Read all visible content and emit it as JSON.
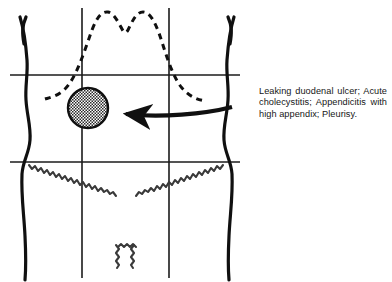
{
  "figure": {
    "caption": "Leaking duodenal ulcer; Acute cholecystitis; Appendicitis with high appendix; Pleurisy.",
    "colors": {
      "ink": "#101010",
      "grid": "#1b1b1b",
      "background": "#ffffff",
      "lesion_fill": "#9a9a9a",
      "lesion_stroke": "#101010"
    },
    "grid": {
      "horizontal_lines": [
        {
          "name": "subcostal-line",
          "y": 75,
          "x_start": 10,
          "x_end": 240
        },
        {
          "name": "interspinous-line",
          "y": 162,
          "x_start": 10,
          "x_end": 240
        }
      ],
      "vertical_lines": [
        {
          "name": "left-midclavicular-line",
          "x": 82,
          "y_start": 8,
          "y_end": 278
        },
        {
          "name": "right-midclavicular-line",
          "x": 169,
          "y_start": 8,
          "y_end": 278
        }
      ]
    },
    "marker": {
      "name": "pain-site-circle",
      "cx": 88,
      "cy": 108,
      "r": 20,
      "region": "right upper quadrant"
    },
    "pointer": {
      "name": "callout-arrow",
      "from_x": 232,
      "from_y": 107,
      "to_x": 110,
      "to_y": 113
    },
    "landmarks": [
      {
        "name": "costal-margin",
        "style": "dashed"
      },
      {
        "name": "inguinal-ligament",
        "style": "hatched"
      },
      {
        "name": "body-outline",
        "style": "solid"
      }
    ]
  }
}
